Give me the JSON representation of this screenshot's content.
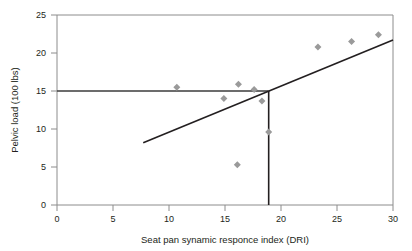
{
  "chart_data": {
    "type": "scatter",
    "title": "",
    "xlabel": "Seat pan synamic responce index (DRI)",
    "ylabel": "Pelvic load (100 lbs)",
    "xlim": [
      0,
      30
    ],
    "ylim": [
      0,
      25
    ],
    "xticks": [
      0,
      5,
      10,
      15,
      20,
      25,
      30
    ],
    "yticks": [
      0,
      5,
      10,
      15,
      20,
      25
    ],
    "xtick_labels": [
      "0",
      "5",
      "10",
      "15",
      "20",
      "25",
      "30"
    ],
    "ytick_labels": [
      "0",
      "5",
      "10",
      "15",
      "20",
      "25"
    ],
    "grid": false,
    "legend": null,
    "marker": {
      "shape": "diamond",
      "color": "#9a9a9a",
      "size": 7
    },
    "points": [
      {
        "x": 10.7,
        "y": 15.5
      },
      {
        "x": 14.9,
        "y": 14.0
      },
      {
        "x": 16.1,
        "y": 5.3
      },
      {
        "x": 16.2,
        "y": 15.9
      },
      {
        "x": 17.6,
        "y": 15.2
      },
      {
        "x": 18.3,
        "y": 13.7
      },
      {
        "x": 18.9,
        "y": 9.6
      },
      {
        "x": 23.3,
        "y": 20.8
      },
      {
        "x": 26.3,
        "y": 21.5
      },
      {
        "x": 28.7,
        "y": 22.4
      }
    ],
    "trend_line": {
      "name": "regression-line",
      "color": "#231f20",
      "x0": 7.7,
      "y0": 8.2,
      "x1": 30.0,
      "y1": 21.7
    },
    "reference_lines": [
      {
        "name": "horizontal-threshold",
        "orientation": "horizontal",
        "value": 15,
        "x_start": 0,
        "x_end": 18.9,
        "color": "#3b3b3b"
      },
      {
        "name": "vertical-threshold",
        "orientation": "vertical",
        "value": 18.9,
        "y_start": 0,
        "y_end": 15,
        "color": "#231f20"
      }
    ],
    "axis_color": "#8c8c8c"
  }
}
